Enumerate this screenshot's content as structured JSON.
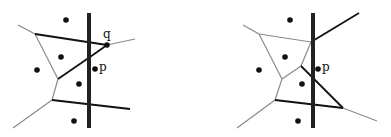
{
  "diagram": {
    "type": "voronoi-update-illustration",
    "colors": {
      "black_edge": "#111111",
      "gray_edge": "#8a8a8a",
      "sweep_bar": "#222222",
      "site": "#111111"
    },
    "panels": [
      {
        "id": "left",
        "labels": {
          "q": "q",
          "p": "p"
        },
        "sweep_bar": {
          "x": 89,
          "y1": 13,
          "y2": 128
        },
        "sites": [
          {
            "x": 66,
            "y": 20
          },
          {
            "x": 61,
            "y": 57
          },
          {
            "x": 37,
            "y": 70
          },
          {
            "x": 79,
            "y": 84
          },
          {
            "x": 74,
            "y": 121
          }
        ],
        "p": {
          "x": 95,
          "y": 69
        },
        "q": {
          "x": 107,
          "y": 45
        },
        "gray_edges": [
          [
            18,
            25,
            35,
            34
          ],
          [
            35,
            34,
            58,
            79
          ],
          [
            58,
            79,
            52,
            100
          ],
          [
            52,
            100,
            13,
            128
          ],
          [
            107,
            45,
            135,
            39
          ]
        ],
        "black_edges": [
          [
            35,
            34,
            107,
            45
          ],
          [
            107,
            45,
            90,
            57
          ],
          [
            90,
            57,
            58,
            79
          ],
          [
            89,
            43,
            90,
            57
          ],
          [
            52,
            100,
            130,
            109
          ]
        ]
      },
      {
        "id": "right",
        "labels": {
          "p": "p"
        },
        "sweep_bar": {
          "x": 313,
          "y1": 13,
          "y2": 128
        },
        "sites": [
          {
            "x": 290,
            "y": 20
          },
          {
            "x": 285,
            "y": 57
          },
          {
            "x": 259,
            "y": 70
          },
          {
            "x": 302,
            "y": 84
          },
          {
            "x": 298,
            "y": 121
          }
        ],
        "p": {
          "x": 318,
          "y": 69
        },
        "gray_edges": [
          [
            243,
            25,
            259,
            34
          ],
          [
            259,
            34,
            311,
            42
          ],
          [
            259,
            34,
            282,
            79
          ],
          [
            311,
            42,
            301,
            66
          ],
          [
            301,
            66,
            282,
            79
          ],
          [
            282,
            79,
            275,
            100
          ],
          [
            275,
            100,
            237,
            128
          ],
          [
            343,
            108,
            377,
            121
          ]
        ],
        "black_edges": [
          [
            311,
            42,
            359,
            13
          ],
          [
            301,
            66,
            343,
            108
          ],
          [
            275,
            100,
            343,
            108
          ]
        ]
      }
    ]
  }
}
